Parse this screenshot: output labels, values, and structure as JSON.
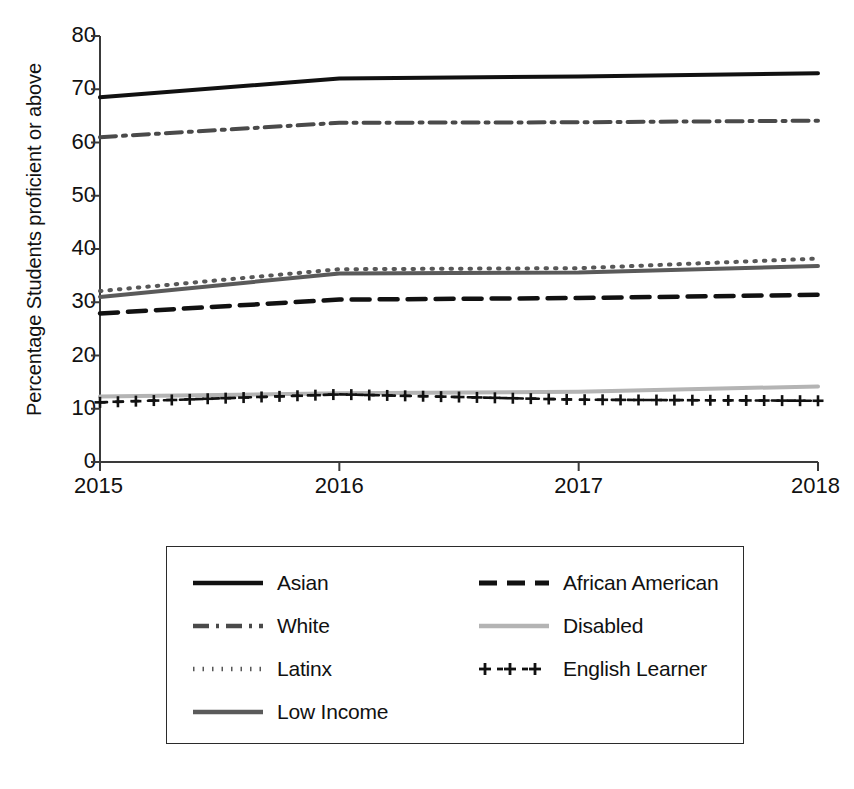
{
  "chart_data": {
    "type": "line",
    "title": "",
    "xlabel": "",
    "ylabel": "Percentage Students proficient or above",
    "x": [
      2015,
      2016,
      2017,
      2018
    ],
    "xlim": [
      2015,
      2018
    ],
    "ylim": [
      0,
      80
    ],
    "xticks": [
      "2015",
      "2016",
      "2017",
      "2018"
    ],
    "yticks": [
      "0",
      "10",
      "20",
      "30",
      "40",
      "50",
      "60",
      "70",
      "80"
    ],
    "grid": false,
    "legend_position": "below-plot",
    "series": [
      {
        "name": "Asian",
        "values": [
          68.5,
          72.0,
          72.4,
          73.0
        ],
        "style": "solid",
        "color": "#111111",
        "width": 4
      },
      {
        "name": "White",
        "values": [
          61.0,
          63.7,
          63.8,
          64.1
        ],
        "style": "dash-dot",
        "color": "#4a4a4a",
        "width": 4
      },
      {
        "name": "Latinx",
        "values": [
          32.1,
          36.2,
          36.4,
          38.2
        ],
        "style": "dotted",
        "color": "#575757",
        "width": 4
      },
      {
        "name": "Low Income",
        "values": [
          31.0,
          35.4,
          35.6,
          36.8
        ],
        "style": "solid",
        "color": "#5a5a5a",
        "width": 4
      },
      {
        "name": "African American",
        "values": [
          27.9,
          30.5,
          30.8,
          31.4
        ],
        "style": "dashed",
        "color": "#111111",
        "width": 4.5
      },
      {
        "name": "Disabled",
        "values": [
          12.3,
          12.9,
          13.2,
          14.2
        ],
        "style": "solid",
        "color": "#b4b4b4",
        "width": 4
      },
      {
        "name": "English Learner",
        "values": [
          11.2,
          12.7,
          11.7,
          11.5
        ],
        "style": "plus-dash",
        "color": "#111111",
        "width": 2.6
      }
    ]
  },
  "legend": {
    "columns": [
      [
        "Asian",
        "White",
        "Latinx",
        "Low Income"
      ],
      [
        "African American",
        "Disabled",
        "English Learner"
      ]
    ]
  },
  "colors": {
    "axis": "#3a3a3a",
    "text": "#111111",
    "background": "#ffffff"
  }
}
